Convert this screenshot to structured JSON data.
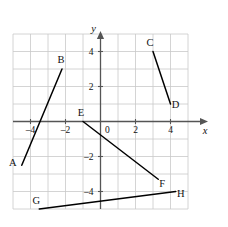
{
  "figure": {
    "type": "coordinate-plane"
  },
  "axes": {
    "x_axis_label": "x",
    "y_axis_label": "y",
    "origin_label": "0",
    "x_tick_labels": [
      "–4",
      "–2",
      "2",
      "4"
    ],
    "x_tick_values": [
      -4,
      -2,
      2,
      4
    ],
    "y_tick_labels": [
      "4",
      "2",
      "–2",
      "–4"
    ],
    "y_tick_values": [
      4,
      2,
      -2,
      -4
    ],
    "xlim": [
      -5,
      5
    ],
    "ylim": [
      -5,
      5
    ],
    "grid": true,
    "grid_step": 1,
    "axis_color": "#555555",
    "grid_color": "#c9c9c9",
    "segment_color": "#000000"
  },
  "chart_data": {
    "type": "scatter",
    "xlabel": "x",
    "ylabel": "y",
    "xlim": [
      -5,
      5
    ],
    "ylim": [
      -5,
      5
    ],
    "grid": true,
    "legend": "none",
    "points": [
      {
        "label": "A",
        "x": -4.5,
        "y": -2.5
      },
      {
        "label": "B",
        "x": -2.2,
        "y": 3.0
      },
      {
        "label": "C",
        "x": 3.0,
        "y": 4.0
      },
      {
        "label": "D",
        "x": 4.0,
        "y": 1.0
      },
      {
        "label": "E",
        "x": -1.0,
        "y": 0.0
      },
      {
        "label": "F",
        "x": 3.3,
        "y": -3.3
      },
      {
        "label": "G",
        "x": -3.5,
        "y": -5.0
      },
      {
        "label": "H",
        "x": 4.3,
        "y": -4.0
      }
    ],
    "segments": [
      {
        "name": "AB",
        "from": "A",
        "to": "B"
      },
      {
        "name": "CD",
        "from": "C",
        "to": "D"
      },
      {
        "name": "EF",
        "from": "E",
        "to": "F"
      },
      {
        "name": "GH",
        "from": "G",
        "to": "H"
      }
    ]
  },
  "point_labels": {
    "A": "A",
    "B": "B",
    "C": "C",
    "D": "D",
    "E": "E",
    "F": "F",
    "G": "G",
    "H": "H"
  }
}
